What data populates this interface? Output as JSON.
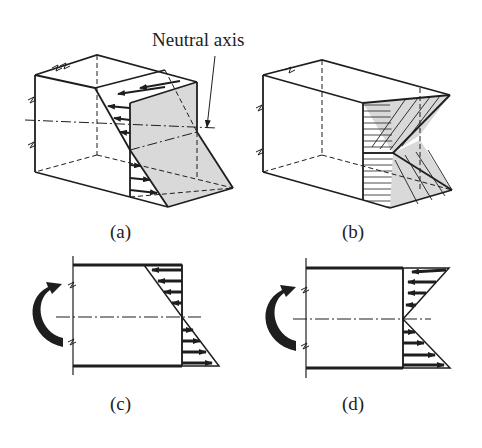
{
  "figure": {
    "annotation": "Neutral axis",
    "panels": [
      {
        "id": "a",
        "label": "(a)",
        "description": "3D beam segment with linear bending stress distribution; shaded neutral plane"
      },
      {
        "id": "b",
        "label": "(b)",
        "description": "3D beam segment with hatched stress wedges above and below neutral axis"
      },
      {
        "id": "c",
        "label": "(c)",
        "description": "Side view: applied moment, linear stress distribution with compression arrows above and tension arrows below neutral axis"
      },
      {
        "id": "d",
        "label": "(d)",
        "description": "Side view: applied moment, stress distribution arrows pointing left above and right below neutral axis"
      }
    ]
  },
  "colors": {
    "line": "#1e1e1e",
    "shade": "#d9d9d9",
    "background": "#ffffff"
  }
}
